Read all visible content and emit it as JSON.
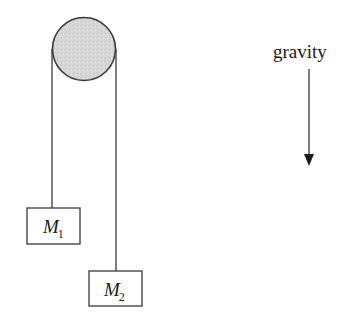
{
  "diagram": {
    "type": "atwood-machine",
    "pulley": {
      "cx": 84,
      "cy": 49,
      "r": 31,
      "fill": "#d4d4d4",
      "stroke": "#3a3a3a"
    },
    "ropes": [
      {
        "id": "left",
        "x": 52,
        "y1": 49,
        "y2": 208
      },
      {
        "id": "right",
        "x": 116,
        "y1": 49,
        "y2": 271
      }
    ],
    "masses": [
      {
        "id": "M1",
        "label_main": "M",
        "label_sub": "1",
        "x": 27,
        "y": 208,
        "w": 53,
        "h": 36
      },
      {
        "id": "M2",
        "label_main": "M",
        "label_sub": "2",
        "x": 89,
        "y": 271,
        "w": 53,
        "h": 35
      }
    ],
    "gravity": {
      "label": "gravity",
      "arrow_x": 309,
      "arrow_y1": 69,
      "arrow_y2": 167,
      "direction": "down"
    },
    "colors": {
      "line": "#3a3a3a",
      "text": "#1a1a1a",
      "background": "#ffffff"
    }
  }
}
